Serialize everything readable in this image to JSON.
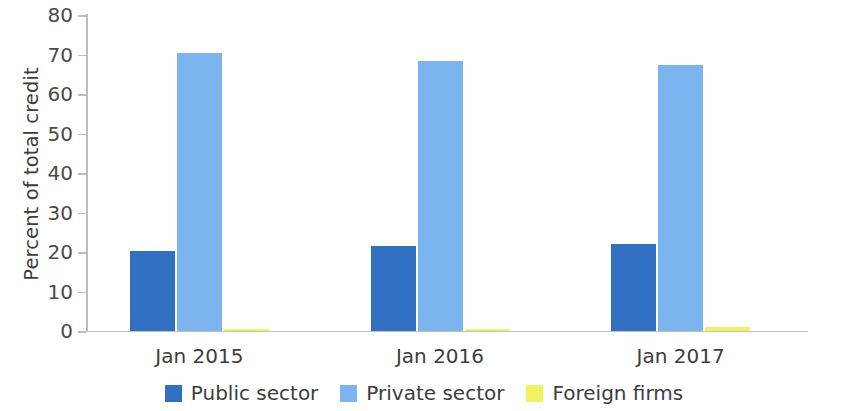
{
  "chart_data": {
    "type": "bar",
    "title": "",
    "subtitle": "",
    "xlabel": "",
    "ylabel": "Percent of total credit",
    "categories": [
      "Jan 2015",
      "Jan 2016",
      "Jan 2017"
    ],
    "series": [
      {
        "name": "Public sector",
        "color": "#3170c0",
        "values": [
          20.3,
          21.5,
          22.0
        ]
      },
      {
        "name": "Private sector",
        "color": "#7cb4ef",
        "values": [
          70.4,
          68.3,
          67.4
        ]
      },
      {
        "name": "Foreign firms",
        "color": "#eff263",
        "values": [
          0.6,
          0.5,
          0.9
        ]
      }
    ],
    "ylim": [
      0,
      80
    ],
    "yticks": [
      0,
      10,
      20,
      30,
      40,
      50,
      60,
      70,
      80
    ],
    "ytick_labels": [
      "0",
      "10",
      "20",
      "30",
      "40",
      "50",
      "60",
      "70",
      "80"
    ],
    "grid": false,
    "legend_position": "bottom"
  },
  "axis": {
    "y_title": "Percent of total credit"
  },
  "legend": {
    "items": [
      {
        "label": "Public sector",
        "key": "public"
      },
      {
        "label": "Private sector",
        "key": "private"
      },
      {
        "label": "Foreign firms",
        "key": "foreign"
      }
    ]
  }
}
